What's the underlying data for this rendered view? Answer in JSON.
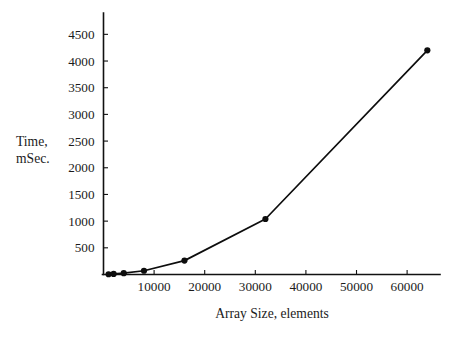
{
  "chart_data": {
    "type": "line",
    "title": "",
    "xlabel": "Array Size, elements",
    "ylabel": "Time,\nmSec.",
    "ylabel_line1": "Time,",
    "ylabel_line2": "mSec.",
    "x": [
      1000,
      2000,
      4000,
      8000,
      16000,
      32000,
      64000
    ],
    "values": [
      5,
      10,
      25,
      70,
      260,
      1040,
      4200
    ],
    "series": [
      {
        "name": "Time",
        "x": [
          1000,
          2000,
          4000,
          8000,
          16000,
          32000,
          64000
        ],
        "values": [
          5,
          10,
          25,
          70,
          260,
          1040,
          4200
        ]
      }
    ],
    "xlim": [
      0,
      66500
    ],
    "ylim": [
      0,
      4900
    ],
    "xticks": [
      10000,
      20000,
      30000,
      40000,
      50000,
      60000
    ],
    "xtick_labels": [
      "10000",
      "20000",
      "30000",
      "40000",
      "50000",
      "60000"
    ],
    "yticks": [
      500,
      1000,
      1500,
      2000,
      2500,
      3000,
      3500,
      4000,
      4500
    ],
    "ytick_labels": [
      "500",
      "1000",
      "1500",
      "2000",
      "2500",
      "3000",
      "3500",
      "4000",
      "4500"
    ],
    "grid": false,
    "legend": false,
    "legend_position": "none",
    "marker": "filled-circle",
    "line_color": "#0d0d0d",
    "marker_color": "#0d0d0d",
    "background_color": "#ffffff",
    "axis_color": "#111111"
  }
}
